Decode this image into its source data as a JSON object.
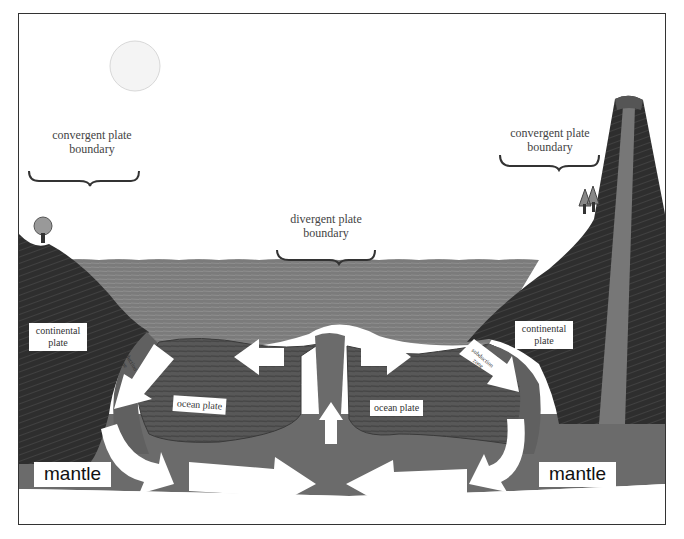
{
  "diagram": {
    "labels": {
      "convergent_left": {
        "line1": "convergent plate",
        "line2": "boundary"
      },
      "divergent": {
        "line1": "divergent plate",
        "line2": "boundary"
      },
      "convergent_right": {
        "line1": "convergent plate",
        "line2": "boundary"
      },
      "continental_left": {
        "line1": "continental",
        "line2": "plate"
      },
      "continental_right": {
        "line1": "continental",
        "line2": "plate"
      },
      "ocean_left": "ocean plate",
      "ocean_right": "ocean plate",
      "subduction_left": {
        "line1": "subduction",
        "line2": "zone"
      },
      "subduction_right": {
        "line1": "subduction",
        "line2": "zone"
      },
      "mantle_left": "mantle",
      "mantle_right": "mantle"
    },
    "colors": {
      "sky": "#ffffff",
      "sun": "#f2f2f2",
      "ocean": "#7a7a7a",
      "continent": "#2e2e2e",
      "ocean_plate": "#5a5a5a",
      "mantle": "#6b6b6b",
      "arrow": "#ffffff"
    }
  }
}
